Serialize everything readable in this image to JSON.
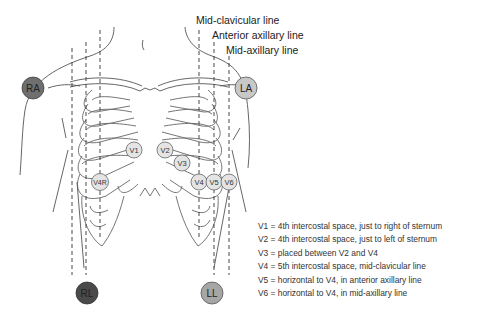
{
  "line_labels": {
    "mid_clavicular": "Mid-clavicular line",
    "anterior_axillary": "Anterior axillary line",
    "mid_axillary": "Mid-axillary line"
  },
  "electrodes": {
    "RA": {
      "label": "RA",
      "color": "#6f6f6f"
    },
    "LA": {
      "label": "LA",
      "color": "#c8c8c8"
    },
    "RL": {
      "label": "RL",
      "color": "#4a4a4a"
    },
    "LL": {
      "label": "LL",
      "color": "#a6a6a6"
    },
    "V1": {
      "label": "V1",
      "color": "#e4e4e4"
    },
    "V2": {
      "label": "V2",
      "color": "#e4e4e4"
    },
    "V3": {
      "label": "V3",
      "color": "#e4e4e4"
    },
    "V4": {
      "label": "V4",
      "color": "#e4e4e4"
    },
    "V5": {
      "label": "V5",
      "color": "#e4e4e4"
    },
    "V6": {
      "label": "V6",
      "color": "#e4e4e4"
    },
    "V4R": {
      "label": "V4R",
      "color": "#e4e4e4"
    }
  },
  "legend": [
    "V1 = 4th intercostal space, just to right of sternum",
    "V2 = 4th intercostal space, just to left of sternum",
    "V3 = placed between V2 and V4",
    "V4 = 5th intercostal space, mid-clavicular line",
    "V5 = horizontal to V4, in anterior axillary line",
    "V6 = horizontal to V4, in mid-axillary line"
  ]
}
